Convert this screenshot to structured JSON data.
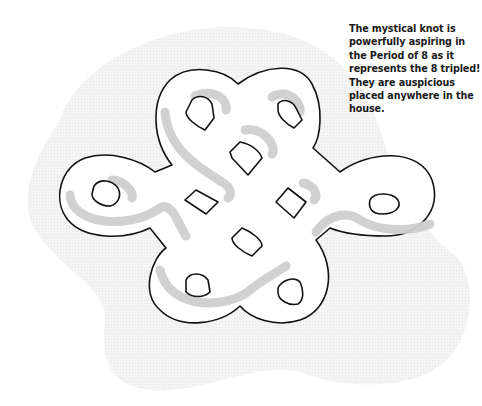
{
  "illustration": {
    "subject": "mystical knot",
    "colors": {
      "outline": "#111111",
      "fill": "#ffffff",
      "shadow": "#cfcfcf",
      "background_blob": "#f1f1f1"
    }
  },
  "caption": {
    "text": "The mystical knot is powerfully aspiring in the Period of 8 as it represents the 8 tripled! They are auspicious placed anywhere in the house."
  }
}
